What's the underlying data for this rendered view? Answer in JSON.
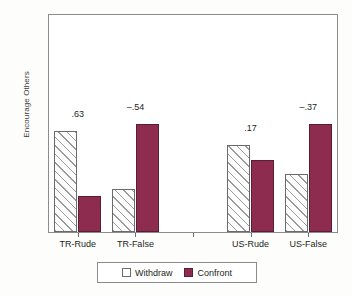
{
  "chart_data": {
    "type": "bar",
    "title": "",
    "xlabel": "",
    "ylabel": "Encourage Others",
    "ylim": [
      3,
      6
    ],
    "ytick_labels": [
      "6",
      "5.5",
      "5",
      "4.5",
      "4",
      "3.5",
      "3"
    ],
    "ytick_values": [
      6,
      5.5,
      5,
      4.5,
      4,
      3.5,
      3
    ],
    "grid": false,
    "legend_position": "bottom-center",
    "categories": [
      "TR-Rude",
      "TR-False",
      "",
      "US-Rude",
      "US-False"
    ],
    "series": [
      {
        "name": "Withdraw",
        "fill": "hatched-white",
        "values": [
          4.4,
          3.6,
          null,
          4.2,
          3.8
        ]
      },
      {
        "name": "Confront",
        "fill": "#8e2c4f",
        "values": [
          3.5,
          4.5,
          null,
          4.0,
          4.5
        ]
      }
    ],
    "annotations": [
      {
        "category": "TR-Rude",
        "text": ".63"
      },
      {
        "category": "TR-False",
        "text": "–.54"
      },
      {
        "category": "US-Rude",
        "text": ".17"
      },
      {
        "category": "US-False",
        "text": "–.37"
      }
    ]
  },
  "axis": {
    "y_title": "Encourage Others",
    "y_ticks": [
      {
        "label": "6",
        "value": 6
      },
      {
        "label": "5.5",
        "value": 5.5
      },
      {
        "label": "5",
        "value": 5
      },
      {
        "label": "4.5",
        "value": 4.5
      },
      {
        "label": "4",
        "value": 4
      },
      {
        "label": "3.5",
        "value": 3.5
      },
      {
        "label": "3",
        "value": 3
      }
    ],
    "x_ticks": [
      {
        "label": "TR-Rude"
      },
      {
        "label": "TR-False"
      },
      {
        "label": ""
      },
      {
        "label": "US-Rude"
      },
      {
        "label": "US-False"
      }
    ]
  },
  "legend": {
    "items": [
      {
        "label": "Withdraw",
        "color": "#ffffff"
      },
      {
        "label": "Confront",
        "color": "#8e2c4f"
      }
    ]
  },
  "value_labels": {
    "tr_rude": ".63",
    "tr_false": "–.54",
    "us_rude": ".17",
    "us_false": "–.37"
  }
}
